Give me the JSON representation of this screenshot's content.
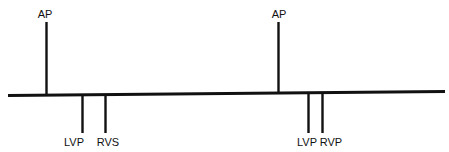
{
  "figure": {
    "kind": "cardiac-pacing-timing-diagram",
    "width": 449,
    "height": 152,
    "background_color": "#ffffff",
    "line_color": "#111111",
    "text_color": "#111111"
  },
  "baseline": {
    "name": "timeline-baseline",
    "x_start": 8,
    "y_start": 95.5,
    "x_end": 445,
    "y_end": 91.5,
    "thickness": 3.2
  },
  "events": [
    {
      "id": "ap-1",
      "label": "AP",
      "full_name": "Atrial Pace",
      "direction": "up",
      "x": 46.5,
      "baseline_y": 95.2,
      "tip_y": 22,
      "thickness": 2.4,
      "label_x": 45,
      "label_y": 18,
      "label_anchor": "middle"
    },
    {
      "id": "lvp-1",
      "label": "LVP",
      "full_name": "Left Ventricular Pace",
      "direction": "down",
      "x": 82.5,
      "baseline_y": 94.8,
      "tip_y": 133,
      "thickness": 2.4,
      "label_x": 74,
      "label_y": 146,
      "label_anchor": "middle"
    },
    {
      "id": "rvs-1",
      "label": "RVS",
      "full_name": "Right Ventricular Sense",
      "direction": "down",
      "x": 105.5,
      "baseline_y": 94.6,
      "tip_y": 133,
      "thickness": 2.4,
      "label_x": 108,
      "label_y": 146,
      "label_anchor": "middle"
    },
    {
      "id": "ap-2",
      "label": "AP",
      "full_name": "Atrial Pace",
      "direction": "up",
      "x": 278.5,
      "baseline_y": 93.0,
      "tip_y": 22,
      "thickness": 2.4,
      "label_x": 279,
      "label_y": 18,
      "label_anchor": "middle"
    },
    {
      "id": "lvp-2",
      "label": "LVP",
      "full_name": "Left Ventricular Pace",
      "direction": "down",
      "x": 308.5,
      "baseline_y": 92.8,
      "tip_y": 133,
      "thickness": 2.4,
      "label_x": 307,
      "label_y": 146,
      "label_anchor": "middle"
    },
    {
      "id": "rvp-2",
      "label": "RVP",
      "full_name": "Right Ventricular Pace",
      "direction": "down",
      "x": 322.5,
      "baseline_y": 92.6,
      "tip_y": 133,
      "thickness": 2.4,
      "label_x": 331,
      "label_y": 146,
      "label_anchor": "middle"
    }
  ]
}
